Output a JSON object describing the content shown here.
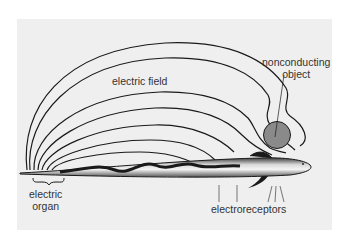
{
  "figure": {
    "background_color": "#efefef",
    "line_color": "#1a1a1a",
    "object_color": "#8a8a8a"
  },
  "labels": {
    "electric_field": "electric field",
    "nonconducting_object_line1": "nonconducting",
    "nonconducting_object_line2": "object",
    "electric_organ_line1": "electric",
    "electric_organ_line2": "organ",
    "electroreceptors": "electroreceptors"
  }
}
